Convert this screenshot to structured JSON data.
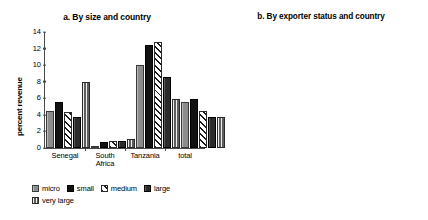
{
  "figure": {
    "panels": [
      "a",
      "b"
    ]
  },
  "panel_a": {
    "title": "a. By size and country",
    "ylabel": "percent revenue",
    "yticks": [
      "14",
      "12",
      "10",
      "8",
      "6",
      "4",
      "2",
      "0"
    ],
    "xticks": [
      "Senegal",
      "South\nAfrica",
      "Tanzania",
      "total"
    ],
    "legend": [
      {
        "label": "micro",
        "fill": "gray"
      },
      {
        "label": "small",
        "fill": "black"
      },
      {
        "label": "medium",
        "fill": "hatch"
      },
      {
        "label": "large",
        "fill": "dark"
      },
      {
        "label": "very large",
        "fill": "vstripe"
      }
    ]
  },
  "panel_b": {
    "title": "b. By exporter status and country",
    "ylabel": "percent of revenue",
    "yticks": [
      "12",
      "10",
      "8",
      "6",
      "4",
      "2",
      "0"
    ],
    "xticks": [
      "Senegal",
      "South\nAfrica",
      "Tanzania",
      "total"
    ],
    "legend": [
      {
        "label": "nonexporter",
        "fill": "gray"
      },
      {
        "label": "exporter",
        "fill": "black"
      }
    ]
  },
  "chart_data": [
    {
      "type": "bar",
      "panel": "a",
      "title": "a. By size and country",
      "xlabel": "",
      "ylabel": "percent revenue",
      "ylim": [
        0,
        14
      ],
      "ytick_step": 2,
      "grid": false,
      "legend_position": "bottom",
      "categories": [
        "Senegal",
        "South Africa",
        "Tanzania",
        "total"
      ],
      "series": [
        {
          "name": "micro",
          "color": "#8c8c8c",
          "values": [
            4.5,
            0.3,
            10.0,
            5.6
          ]
        },
        {
          "name": "small",
          "color": "#111111",
          "values": [
            5.6,
            0.7,
            12.4,
            5.9
          ]
        },
        {
          "name": "medium",
          "color": "#ffffff",
          "values": [
            4.4,
            0.9,
            12.8,
            4.5
          ]
        },
        {
          "name": "large",
          "color": "#2b2b2b",
          "values": [
            3.7,
            0.8,
            8.6,
            3.8
          ]
        },
        {
          "name": "very large",
          "color": "#6f6f6f",
          "values": [
            8.0,
            1.1,
            5.9,
            3.7
          ]
        }
      ]
    },
    {
      "type": "bar",
      "panel": "b",
      "title": "b. By exporter status and country",
      "xlabel": "",
      "ylabel": "percent of revenue",
      "ylim": [
        0,
        12
      ],
      "ytick_step": 2,
      "grid": false,
      "legend_position": "bottom",
      "categories": [
        "Senegal",
        "South Africa",
        "Tanzania",
        "total"
      ],
      "series": [
        {
          "name": "nonexporter",
          "color": "#8c8c8c",
          "values": [
            5.7,
            1.25,
            11.2,
            5.65
          ]
        },
        {
          "name": "exporter",
          "color": "#111111",
          "values": [
            4.15,
            0.6,
            9.4,
            2.9
          ]
        }
      ]
    }
  ]
}
